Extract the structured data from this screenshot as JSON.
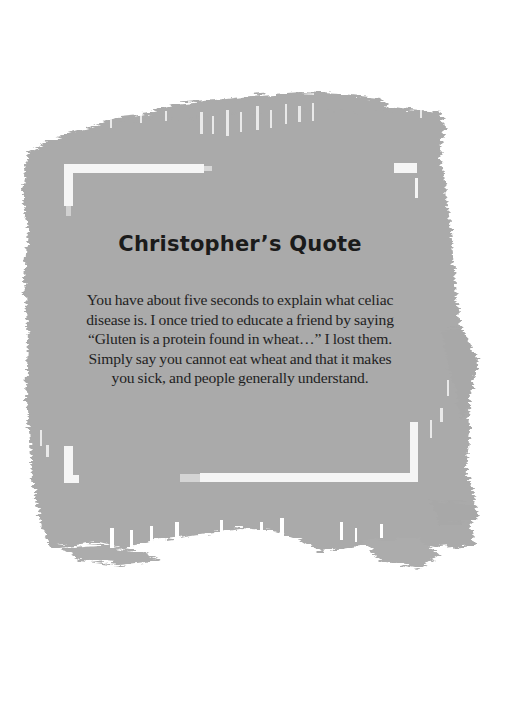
{
  "colors": {
    "background": "#ffffff",
    "brush": "#aaaaaa",
    "brush_dark": "#a3a3a3",
    "frame": "#f4f4f4",
    "text": "#1f1f1f"
  },
  "quote": {
    "title": "Christopher’s Quote",
    "lines": [
      "You have about five seconds to explain what celiac",
      "disease is. I once tried to educate a friend by saying",
      "“Gluten is a protein found in wheat…” I lost them.",
      "Simply say you cannot eat wheat and that it makes",
      "you sick, and people generally understand."
    ]
  }
}
